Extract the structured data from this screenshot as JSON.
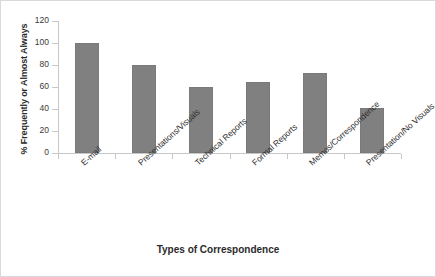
{
  "chart_data": {
    "type": "bar",
    "title": "",
    "xlabel": "Types of Correspondence",
    "ylabel": "% Frequently or Almost Always",
    "categories": [
      "E-mail",
      "Presentations/Visuals",
      "Technical Reports",
      "Formal Reports",
      "Memos/Correspondence",
      "Presentation/No Visuals"
    ],
    "values": [
      100,
      80,
      60,
      65,
      73,
      41
    ],
    "ylim": [
      0,
      120
    ],
    "ytick_labels": [
      "0",
      "20",
      "40",
      "60",
      "80",
      "100",
      "120"
    ],
    "ytick_values": [
      0,
      20,
      40,
      60,
      80,
      100,
      120
    ],
    "grid": false,
    "legend": false,
    "bar_color": "#808080",
    "axis_color": "#c8c8c8",
    "frame_color": "#d9d9d9"
  }
}
